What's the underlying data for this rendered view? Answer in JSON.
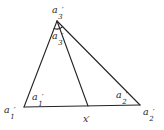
{
  "figure": {
    "background_color": "#ffffff",
    "ink_color": "#242424",
    "labels": {
      "vertex_a3_top": {
        "base": "a",
        "sub": "3",
        "prime": "′"
      },
      "angle_a3": {
        "base": "a",
        "sub": "3",
        "prime": "′"
      },
      "angle_a1": {
        "base": "a",
        "sub": "1",
        "prime": "′"
      },
      "angle_a2": {
        "base": "a",
        "sub": "2",
        "prime": "′"
      },
      "vertex_a1": {
        "base": "a",
        "sub": "1",
        "prime": "′"
      },
      "vertex_a2": {
        "base": "a",
        "sub": "2",
        "prime": "′"
      },
      "point_x": {
        "base": "x",
        "sub": "",
        "prime": "′"
      }
    }
  }
}
